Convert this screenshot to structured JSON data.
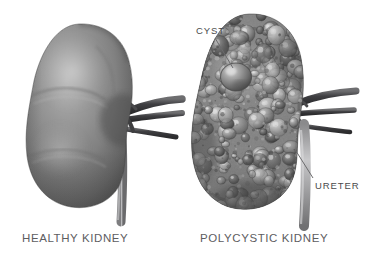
{
  "figure": {
    "background_color": "#ffffff",
    "width": 369,
    "height": 264,
    "style": "grayscale medical illustration",
    "panels": [
      {
        "id": "healthy",
        "caption": "HEALTHY KIDNEY",
        "description": "smooth bean-shaped kidney with renal vessels and ureter",
        "surface": "smooth"
      },
      {
        "id": "polycystic",
        "caption": "POLYCYSTIC KIDNEY",
        "description": "enlarged irregular kidney covered with numerous fluid-filled cysts",
        "surface": "cystic"
      }
    ]
  },
  "captions": {
    "healthy": "HEALTHY KIDNEY",
    "polycystic": "POLYCYSTIC KIDNEY"
  },
  "callouts": {
    "cyst": "CYST",
    "ureter": "URETER"
  },
  "colors": {
    "background": "#ffffff",
    "caption_text": "#5d5d5f",
    "callout_text": "#4a4a4c",
    "leader_line": "#6b6b6d",
    "organ_mid": "#8a8a8a",
    "organ_dark": "#4f4f4f",
    "organ_light": "#c9c9c9",
    "vessel_dark": "#4a4a4c",
    "vessel_light": "#9a9a9c"
  }
}
